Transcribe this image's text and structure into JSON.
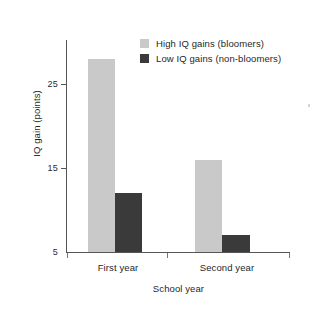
{
  "chart_data": {
    "type": "bar",
    "title": "",
    "xlabel": "School year",
    "ylabel": "IQ gain (points)",
    "categories": [
      "First year",
      "Second year"
    ],
    "series": [
      {
        "name": "High IQ gains (bloomers)",
        "color": "#c9c9c9",
        "values": [
          28,
          16
        ]
      },
      {
        "name": "Low IQ gains (non-bloomers)",
        "color": "#3a3a3a",
        "values": [
          12,
          7
        ]
      }
    ],
    "ylim": [
      5,
      29
    ],
    "yticks": [
      25,
      15,
      5
    ],
    "ytick_labels": [
      "25",
      "15",
      "5"
    ],
    "grid": false,
    "legend_position": "top-right"
  },
  "axis": {
    "line_color": "#555555"
  }
}
